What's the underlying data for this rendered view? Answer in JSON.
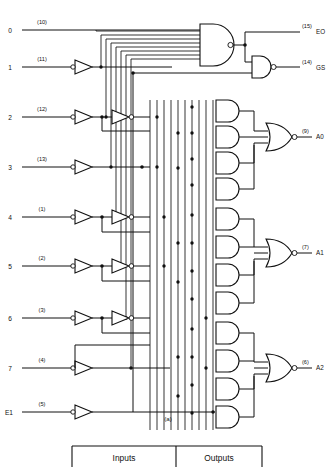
{
  "figure": {
    "caption": "(a)",
    "type": "logic-diagram",
    "device": "8-to-3 priority encoder"
  },
  "inputs": [
    {
      "name": "0",
      "pin": "(10)",
      "y": 30
    },
    {
      "name": "1",
      "pin": "(11)",
      "y": 67
    },
    {
      "name": "2",
      "pin": "(12)",
      "y": 117
    },
    {
      "name": "3",
      "pin": "(13)",
      "y": 167
    },
    {
      "name": "4",
      "pin": "(1)",
      "y": 217
    },
    {
      "name": "5",
      "pin": "(2)",
      "y": 266
    },
    {
      "name": "6",
      "pin": "(3)",
      "y": 318
    },
    {
      "name": "7",
      "pin": "(4)",
      "y": 368
    },
    {
      "name": "E1",
      "pin": "(5)",
      "y": 412
    }
  ],
  "outputs": [
    {
      "name": "EO",
      "pin": "(15)",
      "y": 32
    },
    {
      "name": "GS",
      "pin": "(14)",
      "y": 68
    },
    {
      "name": "A0",
      "pin": "(9)",
      "y": 137
    },
    {
      "name": "A1",
      "pin": "(7)",
      "y": 253
    },
    {
      "name": "A2",
      "pin": "(6)",
      "y": 368
    }
  ],
  "table": {
    "headers": [
      "Inputs",
      "Outputs"
    ]
  },
  "colors": {
    "ink": "#101010",
    "paper": "#ffffff"
  }
}
